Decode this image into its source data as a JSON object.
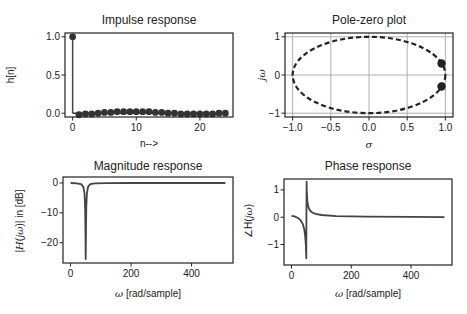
{
  "chart_data": [
    {
      "id": "impulse",
      "type": "scatter",
      "title": "Impulse response",
      "xlabel": "n-->",
      "ylabel": "h[n]",
      "xlim": [
        -1.2,
        25.2
      ],
      "ylim": [
        -0.05,
        1.05
      ],
      "xticks": [
        0,
        10,
        20
      ],
      "xtick_labels": [
        "0",
        "10",
        "20"
      ],
      "yticks": [
        0.0,
        0.5,
        1.0
      ],
      "ytick_labels": [
        "0.0",
        "0.5",
        "1.0"
      ],
      "grid": false,
      "x": [
        0,
        1,
        2,
        3,
        4,
        5,
        6,
        7,
        8,
        9,
        10,
        11,
        12,
        13,
        14,
        15,
        16,
        17,
        18,
        19,
        20,
        21,
        22,
        23,
        24
      ],
      "values": [
        1.0,
        -0.02,
        -0.01,
        -0.01,
        0.0,
        0.01,
        0.01,
        0.02,
        0.02,
        0.02,
        0.02,
        0.02,
        0.02,
        0.01,
        0.01,
        0.0,
        0.0,
        -0.01,
        -0.01,
        -0.01,
        -0.01,
        -0.01,
        -0.01,
        0.0,
        0.0
      ],
      "style": "stem"
    },
    {
      "id": "polezero",
      "type": "scatter",
      "title": "Pole-zero plot",
      "xlabel": "σ",
      "ylabel": "jω",
      "xlim": [
        -1.1,
        1.1
      ],
      "ylim": [
        -1.1,
        1.1
      ],
      "xticks": [
        -1.0,
        -0.5,
        0.0,
        0.5,
        1.0
      ],
      "xtick_labels": [
        "−1.0",
        "−0.5",
        "0.0",
        "0.5",
        "1.0"
      ],
      "yticks": [
        -1,
        0,
        1
      ],
      "ytick_labels": [
        "−1",
        "0",
        "1"
      ],
      "grid": true,
      "unit_circle": true,
      "series": [
        {
          "name": "poles",
          "x": [
            0.95,
            0.95
          ],
          "y": [
            0.3,
            -0.3
          ]
        }
      ]
    },
    {
      "id": "magnitude",
      "type": "line",
      "title": "Magnitude response",
      "xlabel": "ω [rad/sample]",
      "ylabel": "|H(jω)| in [dB]",
      "xlim": [
        -25,
        537
      ],
      "ylim": [
        -26.8,
        2.0
      ],
      "xticks": [
        0,
        200,
        400
      ],
      "xtick_labels": [
        "0",
        "200",
        "400"
      ],
      "yticks": [
        0,
        -10,
        -20
      ],
      "ytick_labels": [
        "0",
        "−10",
        "−20"
      ],
      "grid": false,
      "x": [
        0,
        20,
        35,
        42,
        46,
        48,
        49,
        50,
        51,
        52,
        54,
        58,
        65,
        80,
        120,
        200,
        300,
        400,
        512
      ],
      "values": [
        0,
        -0.1,
        -0.4,
        -1.2,
        -3.5,
        -8,
        -15,
        -25.5,
        -15,
        -8,
        -3.5,
        -1.2,
        -0.4,
        -0.15,
        -0.05,
        -0.02,
        0,
        0,
        0
      ]
    },
    {
      "id": "phase",
      "type": "line",
      "title": "Phase response",
      "xlabel": "ω [rad/sample]",
      "ylabel": "∠H(jω)",
      "xlim": [
        -25,
        537
      ],
      "ylim": [
        -1.75,
        1.4
      ],
      "xticks": [
        0,
        200,
        400
      ],
      "xtick_labels": [
        "0",
        "200",
        "400"
      ],
      "yticks": [
        1,
        0,
        -1
      ],
      "ytick_labels": [
        "1",
        "0",
        "−1"
      ],
      "grid": false,
      "x": [
        0,
        10,
        20,
        30,
        38,
        43,
        46,
        48,
        49,
        49.5,
        50,
        50.5,
        51,
        53,
        56,
        60,
        68,
        80,
        100,
        150,
        250,
        400,
        512
      ],
      "values": [
        0.05,
        0.03,
        -0.02,
        -0.1,
        -0.25,
        -0.45,
        -0.7,
        -1.0,
        -1.3,
        -1.5,
        0.0,
        1.3,
        1.0,
        0.6,
        0.4,
        0.28,
        0.18,
        0.12,
        0.08,
        0.04,
        0.02,
        0.01,
        0.0
      ]
    }
  ]
}
